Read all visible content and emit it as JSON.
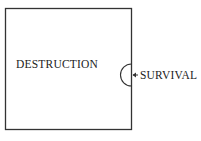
{
  "diagram": {
    "region_label": "DESTRUCTION",
    "niche_label": "SURVIVAL",
    "colors": {
      "line": "#333333",
      "text": "#222222",
      "background": "#ffffff"
    }
  }
}
